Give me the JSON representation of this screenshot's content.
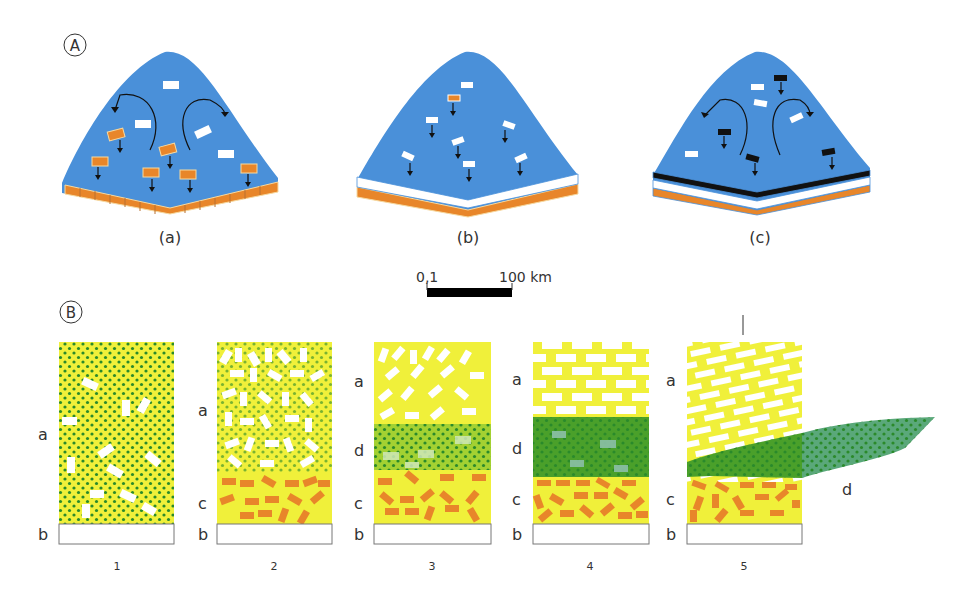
{
  "panel_a": {
    "marker": "A",
    "basins": [
      {
        "caption": "(a)"
      },
      {
        "caption": "(b)"
      },
      {
        "caption": "(c)"
      }
    ]
  },
  "scale_bar": {
    "left_label": "0,1",
    "right_label": "100 km"
  },
  "panel_b": {
    "marker": "B",
    "columns": [
      {
        "number": "1",
        "labels": [
          "a",
          "b"
        ]
      },
      {
        "number": "2",
        "labels": [
          "a",
          "c",
          "b"
        ]
      },
      {
        "number": "3",
        "labels": [
          "a",
          "d",
          "c",
          "b"
        ]
      },
      {
        "number": "4",
        "labels": [
          "a",
          "d",
          "c",
          "b"
        ]
      },
      {
        "number": "5",
        "labels": [
          "a",
          "c",
          "b",
          "d"
        ]
      }
    ]
  },
  "colors": {
    "water": "#4a90d9",
    "sediment_orange": "#e8862a",
    "yellow": "#f0f03a",
    "green_dark": "#4aa02a",
    "green_light": "#9acd32",
    "green_teal": "#5aa87a",
    "dot": "#2a8a2a"
  }
}
